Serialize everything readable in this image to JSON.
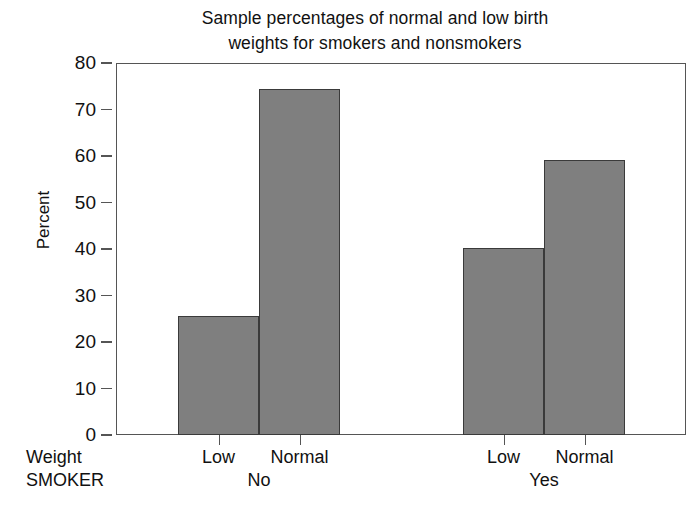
{
  "chart_data": {
    "type": "bar",
    "title": "Sample percentages of normal and low birth weights for smokers and nonsmokers",
    "title_lines": [
      "Sample percentages of normal and low birth",
      "weights for smokers and nonsmokers"
    ],
    "xlabel": "",
    "ylabel": "Percent",
    "ylim": [
      0,
      80
    ],
    "ytick_labels": [
      "0",
      "10",
      "20",
      "30",
      "40",
      "50",
      "60",
      "70",
      "80"
    ],
    "ytick_values": [
      0,
      10,
      20,
      30,
      40,
      50,
      60,
      70,
      80
    ],
    "grid": false,
    "legend": "none",
    "bar_color": "#7f7f7f",
    "bar_edge_color": "#3a3a3a",
    "row_titles": {
      "category_axis": "Weight",
      "group_axis": "SMOKER"
    },
    "groups": [
      {
        "label": "No",
        "categories": [
          "Low",
          "Normal"
        ],
        "values": [
          25.6,
          74.4
        ]
      },
      {
        "label": "Yes",
        "categories": [
          "Low",
          "Normal"
        ],
        "values": [
          40.2,
          59.1
        ]
      }
    ],
    "bars": [
      {
        "group": "No",
        "category": "Low",
        "value": 25.6
      },
      {
        "group": "No",
        "category": "Normal",
        "value": 74.4
      },
      {
        "group": "Yes",
        "category": "Low",
        "value": 40.2
      },
      {
        "group": "Yes",
        "category": "Normal",
        "value": 59.1
      }
    ]
  }
}
